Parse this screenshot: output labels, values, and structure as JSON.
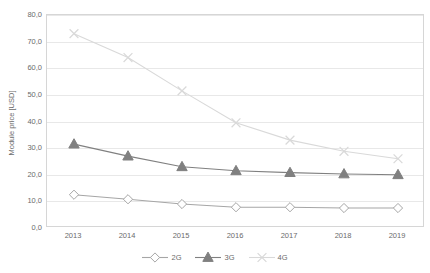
{
  "chart_data": {
    "type": "line",
    "title": "",
    "xlabel": "",
    "ylabel": "Module price [USD]",
    "categories": [
      "2013",
      "2014",
      "2015",
      "2016",
      "2017",
      "2018",
      "2019"
    ],
    "series": [
      {
        "name": "2G",
        "marker": "diamond-open",
        "color": "#a6a6a6",
        "values": [
          12.5,
          10.8,
          9.0,
          7.8,
          7.8,
          7.5,
          7.5
        ]
      },
      {
        "name": "3G",
        "marker": "triangle-filled",
        "color": "#808080",
        "values": [
          31.5,
          27.0,
          23.0,
          21.5,
          20.8,
          20.3,
          20.0
        ]
      },
      {
        "name": "4G",
        "marker": "x-cross",
        "color": "#d9d9d9",
        "values": [
          73.0,
          64.0,
          51.5,
          39.5,
          33.0,
          28.8,
          26.0
        ]
      }
    ],
    "ylim": [
      0,
      80
    ],
    "ytick_values": [
      0,
      10,
      20,
      30,
      40,
      50,
      60,
      70,
      80
    ],
    "ytick_labels": [
      "0,0",
      "10,0",
      "20,0",
      "30,0",
      "40,0",
      "50,0",
      "60,0",
      "70,0",
      "80,0"
    ],
    "grid": true,
    "legend_position": "bottom",
    "legend": [
      "2G",
      "3G",
      "4G"
    ]
  }
}
